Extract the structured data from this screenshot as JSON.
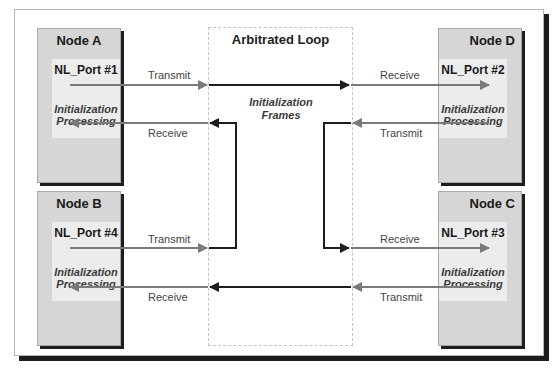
{
  "diagram": {
    "loop_title": "Arbitrated Loop",
    "loop_label_line1": "Initialization",
    "loop_label_line2": "Frames",
    "nodes": [
      {
        "name": "Node A",
        "port": "NL_Port #1",
        "desc_line1": "Initialization",
        "desc_line2": "Processing",
        "transmit": "Transmit",
        "receive": "Receive"
      },
      {
        "name": "Node B",
        "port": "NL_Port #4",
        "desc_line1": "Initialization",
        "desc_line2": "Processing",
        "transmit": "Transmit",
        "receive": "Receive"
      },
      {
        "name": "Node C",
        "port": "NL_Port #3",
        "desc_line1": "Initialization",
        "desc_line2": "Processing",
        "transmit": "Transmit",
        "receive": "Receive"
      },
      {
        "name": "Node D",
        "port": "NL_Port #2",
        "desc_line1": "Initialization",
        "desc_line2": "Processing",
        "transmit": "Transmit",
        "receive": "Receive"
      }
    ],
    "colors": {
      "node_fill": "#d6d6d6",
      "port_fill": "#ececec",
      "link_gray": "#7a7a7a",
      "loop_dark": "#1e1e1e"
    }
  }
}
